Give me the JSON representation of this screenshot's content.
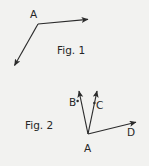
{
  "figure": {
    "background_color": "#f2f2f0",
    "stroke_color": "#2b2b2b",
    "text_color": "#262626",
    "width": 149,
    "height": 166
  },
  "fig1": {
    "caption": "Fig. 1",
    "vertex_label": "A",
    "vertex": {
      "x": 38,
      "y": 24
    },
    "rays": [
      {
        "name": "ray-right",
        "from": {
          "x": 38,
          "y": 24
        },
        "to": {
          "x": 92,
          "y": 19
        },
        "arrow": "end"
      },
      {
        "name": "ray-lower-left",
        "from": {
          "x": 38,
          "y": 24
        },
        "to": {
          "x": 12,
          "y": 70
        },
        "arrow": "end"
      }
    ]
  },
  "fig2": {
    "caption": "Fig. 2",
    "vertex_label": "A",
    "vertex": {
      "x": 88,
      "y": 134
    },
    "labels": {
      "b": "B",
      "c": "C",
      "d": "D"
    },
    "rays": [
      {
        "name": "ray-ab",
        "label": "B",
        "from": {
          "x": 88,
          "y": 134
        },
        "to": {
          "x": 78,
          "y": 86
        },
        "arrow": "end"
      },
      {
        "name": "ray-ac",
        "label": "C",
        "from": {
          "x": 88,
          "y": 134
        },
        "to": {
          "x": 98,
          "y": 86
        },
        "arrow": "end"
      },
      {
        "name": "ray-ad",
        "label": "D",
        "from": {
          "x": 88,
          "y": 134
        },
        "to": {
          "x": 141,
          "y": 121
        },
        "arrow": "end"
      }
    ],
    "tick_marks": [
      {
        "name": "tick-on-ray-ab",
        "x": 77.5,
        "y": 101
      },
      {
        "name": "tick-on-ray-ac",
        "x": 94.5,
        "y": 103
      }
    ]
  }
}
